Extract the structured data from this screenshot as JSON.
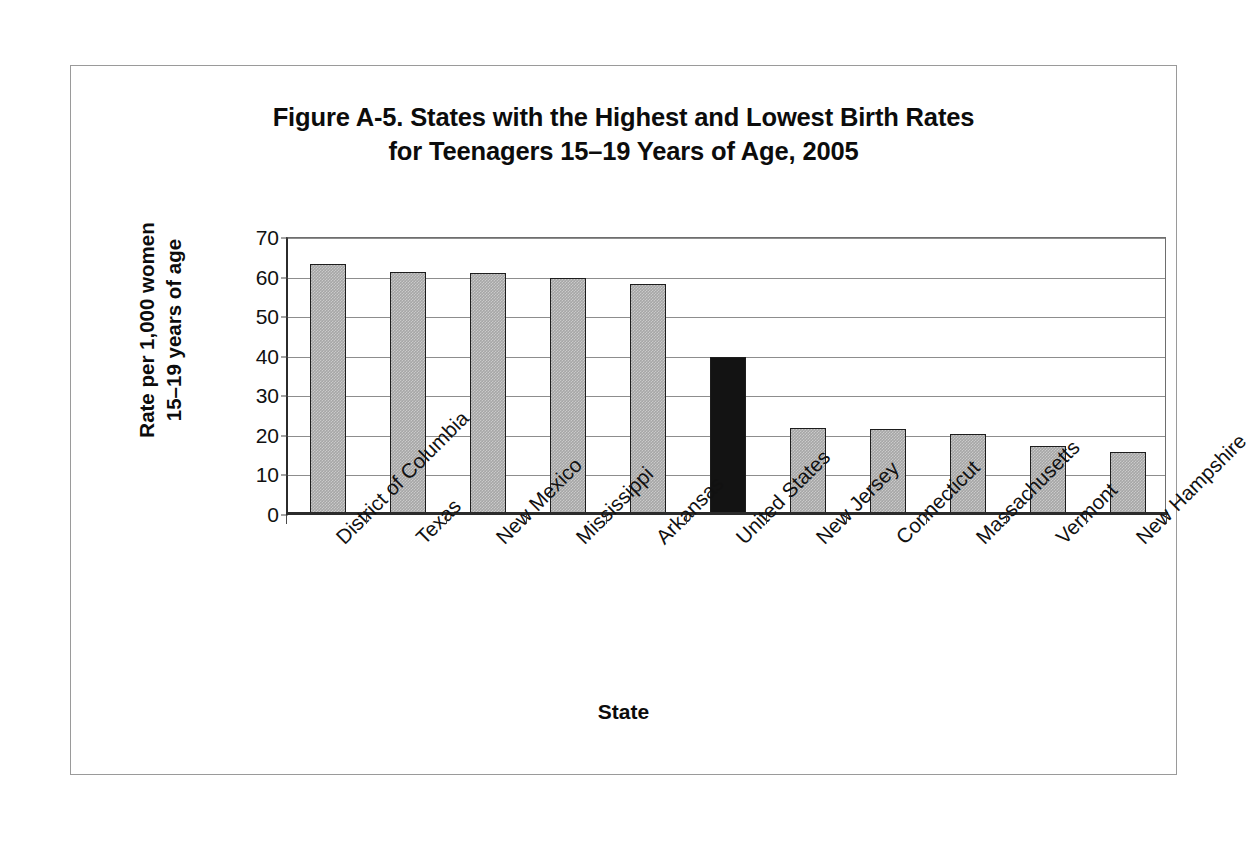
{
  "figure": {
    "title": "Figure A-5. States with the Highest and Lowest Birth Rates\nfor Teenagers 15–19 Years of Age, 2005",
    "frame_color": "#9a9a9a",
    "background_color": "#ffffff"
  },
  "chart_data": {
    "type": "bar",
    "title": "Figure A-5. States with the Highest and Lowest Birth Rates for Teenagers 15–19 Years of Age, 2005",
    "xlabel": "State",
    "ylabel": "Rate per 1,000 women\n15–19 years of age",
    "ylabel_line1": "Rate per 1,000 women",
    "ylabel_line2": "15–19 years of age",
    "ylim": [
      0,
      70
    ],
    "ytick_step": 10,
    "yticks": [
      0,
      10,
      20,
      30,
      40,
      50,
      60,
      70
    ],
    "ytick_labels": [
      "0",
      "10",
      "20",
      "30",
      "40",
      "50",
      "60",
      "70"
    ],
    "grid": true,
    "grid_axis": "y",
    "legend": false,
    "categories": [
      "District of Columbia",
      "Texas",
      "New Mexico",
      "Mississippi",
      "Arkansas",
      "United States",
      "New Jersey",
      "Connecticut",
      "Massachusetts",
      "Vermont",
      "New Hampshire"
    ],
    "values": [
      63.2,
      61.2,
      61.0,
      59.6,
      58.2,
      39.7,
      21.8,
      21.5,
      20.1,
      17.3,
      15.6
    ],
    "bar_colors": [
      "#a6a6a6",
      "#a6a6a6",
      "#a6a6a6",
      "#a6a6a6",
      "#a6a6a6",
      "#131313",
      "#a6a6a6",
      "#a6a6a6",
      "#a6a6a6",
      "#a6a6a6",
      "#a6a6a6"
    ],
    "highlight_category": "United States",
    "highlight_color": "#131313",
    "series_color": "#a6a6a6",
    "bar_edge_color": "#1d1d1d",
    "label_rotation": -45
  }
}
